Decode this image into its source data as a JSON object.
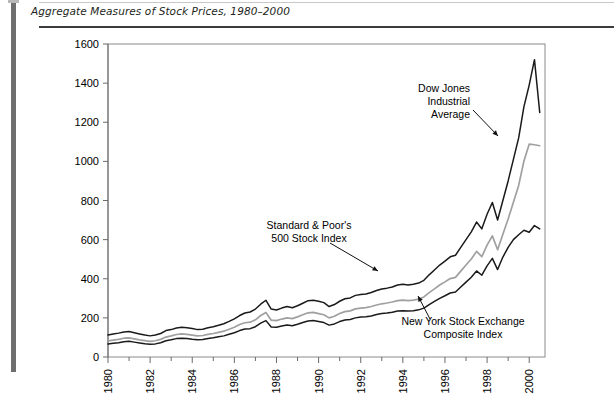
{
  "figure": {
    "title": "Aggregate Measures of Stock Prices, 1980–2000"
  },
  "chart_data": {
    "type": "line",
    "xlabel": "",
    "ylabel": "",
    "xlim": [
      1980,
      2000.75
    ],
    "ylim": [
      0,
      1600
    ],
    "grid": false,
    "legend_position": "inline-annotations",
    "y_ticks": [
      0,
      200,
      400,
      600,
      800,
      1000,
      1200,
      1400,
      1600
    ],
    "x_ticks_major": [
      1980,
      1982,
      1984,
      1986,
      1988,
      1990,
      1992,
      1994,
      1996,
      1998,
      2000
    ],
    "x_ticks_minor": [
      1981,
      1983,
      1985,
      1987,
      1989,
      1991,
      1993,
      1995,
      1997,
      1999
    ],
    "x_tick_labels": [
      "1980",
      "1982",
      "1984",
      "1986",
      "1988",
      "1990",
      "1992",
      "1994",
      "1996",
      "1998",
      "2000"
    ],
    "y_tick_labels": [
      "0",
      "200",
      "400",
      "600",
      "800",
      "1000",
      "1200",
      "1400",
      "1600"
    ],
    "colors": {
      "dow_jones": "#1a1a1a",
      "sp500": "#a0a0a0",
      "nyse": "#1a1a1a",
      "axis": "#6b6b6b",
      "frame": "#8a8a8a"
    },
    "x": [
      1980,
      1980.25,
      1980.5,
      1980.75,
      1981,
      1981.25,
      1981.5,
      1981.75,
      1982,
      1982.25,
      1982.5,
      1982.75,
      1983,
      1983.25,
      1983.5,
      1983.75,
      1984,
      1984.25,
      1984.5,
      1984.75,
      1985,
      1985.25,
      1985.5,
      1985.75,
      1986,
      1986.25,
      1986.5,
      1986.75,
      1987,
      1987.25,
      1987.5,
      1987.75,
      1988,
      1988.25,
      1988.5,
      1988.75,
      1989,
      1989.25,
      1989.5,
      1989.75,
      1990,
      1990.25,
      1990.5,
      1990.75,
      1991,
      1991.25,
      1991.5,
      1991.75,
      1992,
      1992.25,
      1992.5,
      1992.75,
      1993,
      1993.25,
      1993.5,
      1993.75,
      1994,
      1994.25,
      1994.5,
      1994.75,
      1995,
      1995.25,
      1995.5,
      1995.75,
      1996,
      1996.25,
      1996.5,
      1996.75,
      1997,
      1997.25,
      1997.5,
      1997.75,
      1998,
      1998.25,
      1998.5,
      1998.75,
      1999,
      1999.25,
      1999.5,
      1999.75,
      2000,
      2000.25,
      2000.5
    ],
    "series": [
      {
        "name": "Dow Jones Industrial Average",
        "color": "#1a1a1a",
        "values": [
          112,
          118,
          122,
          128,
          130,
          124,
          118,
          112,
          108,
          112,
          120,
          135,
          140,
          148,
          152,
          150,
          146,
          140,
          142,
          150,
          155,
          162,
          170,
          182,
          195,
          212,
          225,
          230,
          245,
          270,
          290,
          245,
          240,
          250,
          258,
          252,
          262,
          275,
          288,
          290,
          285,
          278,
          258,
          268,
          285,
          298,
          302,
          315,
          320,
          322,
          330,
          340,
          348,
          352,
          358,
          368,
          372,
          368,
          372,
          378,
          392,
          420,
          445,
          470,
          490,
          512,
          520,
          560,
          600,
          640,
          690,
          655,
          730,
          790,
          700,
          800,
          900,
          1010,
          1120,
          1280,
          1390,
          1520,
          1250
        ]
      },
      {
        "name": "Standard & Poor's 500 Stock Index",
        "color": "#a0a0a0",
        "values": [
          82,
          86,
          90,
          96,
          98,
          93,
          88,
          84,
          80,
          83,
          90,
          102,
          108,
          115,
          118,
          116,
          112,
          108,
          110,
          116,
          120,
          126,
          132,
          142,
          152,
          166,
          175,
          178,
          190,
          212,
          228,
          188,
          186,
          194,
          200,
          196,
          205,
          216,
          226,
          228,
          222,
          216,
          200,
          208,
          222,
          232,
          236,
          246,
          250,
          252,
          258,
          266,
          272,
          276,
          281,
          288,
          291,
          288,
          291,
          296,
          307,
          329,
          348,
          368,
          384,
          401,
          407,
          439,
          470,
          501,
          540,
          513,
          572,
          619,
          548,
          627,
          705,
          791,
          877,
          1002,
          1088,
          1085,
          1080
        ]
      },
      {
        "name": "New York Stock Exchange Composite Index",
        "color": "#1a1a1a",
        "values": [
          66,
          70,
          73,
          78,
          80,
          76,
          72,
          68,
          65,
          67,
          73,
          83,
          88,
          94,
          96,
          95,
          91,
          88,
          89,
          94,
          98,
          103,
          108,
          116,
          124,
          135,
          143,
          145,
          155,
          173,
          186,
          153,
          152,
          158,
          163,
          160,
          167,
          176,
          184,
          186,
          181,
          176,
          163,
          169,
          181,
          189,
          192,
          200,
          204,
          206,
          210,
          217,
          222,
          225,
          229,
          235,
          237,
          235,
          237,
          241,
          250,
          268,
          284,
          300,
          313,
          327,
          332,
          358,
          383,
          408,
          440,
          418,
          466,
          504,
          447,
          511,
          560,
          600,
          625,
          648,
          638,
          672,
          655
        ]
      }
    ],
    "annotations": [
      {
        "name": "dow-jones-annotation",
        "text_lines": [
          "Dow Jones",
          "Industrial",
          "Average"
        ],
        "align": "end",
        "text_x": 470,
        "text_y": 92,
        "leader": [
          [
            473,
            110
          ],
          [
            498,
            136
          ]
        ]
      },
      {
        "name": "sp500-annotation",
        "text_lines": [
          "Standard & Poor's",
          "500 Stock Index"
        ],
        "align": "middle",
        "text_x": 309,
        "text_y": 229,
        "leader": [
          [
            330,
            243
          ],
          [
            378,
            271
          ]
        ]
      },
      {
        "name": "nyse-annotation",
        "text_lines": [
          "New York Stock Exchange",
          "Composite Index"
        ],
        "align": "middle",
        "text_x": 463,
        "text_y": 325,
        "leader": [
          [
            430,
            319
          ],
          [
            418,
            296
          ]
        ]
      }
    ]
  }
}
